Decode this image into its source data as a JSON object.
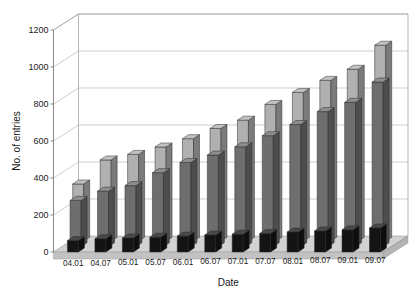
{
  "chart_data": {
    "type": "bar",
    "title": "",
    "xlabel": "Date",
    "ylabel": "No. of entries",
    "ylim": [
      0,
      1200
    ],
    "yticks": [
      0,
      200,
      400,
      600,
      800,
      1000,
      1200
    ],
    "grid": true,
    "legend": "none",
    "projection": "3d-grouped-depth",
    "categories": [
      "04.01",
      "04.07",
      "05.01",
      "05.07",
      "06.01",
      "06.07",
      "07.01",
      "07.07",
      "08.01",
      "08.07",
      "09.01",
      "09.07"
    ],
    "series": [
      {
        "name": "back-series",
        "color": "#b0b0b0",
        "values": [
          310,
          440,
          470,
          510,
          555,
          610,
          655,
          740,
          805,
          870,
          930,
          1060
        ]
      },
      {
        "name": "middle-series",
        "color": "#6e6e6e",
        "values": [
          250,
          300,
          330,
          400,
          455,
          495,
          540,
          600,
          660,
          730,
          780,
          890
        ]
      },
      {
        "name": "front-series",
        "color": "#141414",
        "values": [
          62,
          72,
          76,
          80,
          86,
          92,
          96,
          100,
          108,
          114,
          120,
          130
        ]
      }
    ]
  },
  "axes": {
    "y_tick_labels": [
      "1200",
      "1000",
      "800",
      "600",
      "400",
      "200",
      "0"
    ],
    "y_axis_title": "No. of entries",
    "x_axis_title": "Date",
    "x_tick_labels": [
      "04.01",
      "04.07",
      "05.01",
      "05.07",
      "06.01",
      "06.07",
      "07.01",
      "07.07",
      "08.01",
      "08.07",
      "09.01",
      "09.07"
    ]
  },
  "colors": {
    "back_bar": "#b0b0b0",
    "back_bar_side": "#8d8d8d",
    "back_bar_top": "#c8c8c8",
    "middle_bar": "#6e6e6e",
    "middle_bar_side": "#4e4e4e",
    "middle_bar_top": "#858585",
    "front_bar": "#141414",
    "front_bar_side": "#000000",
    "front_bar_top": "#3a3a3a",
    "floor": "#d2d2d2",
    "grid": "#b9b9b9",
    "axis": "#7a7a7a",
    "text": "#1a1a1a",
    "background": "#ffffff"
  }
}
